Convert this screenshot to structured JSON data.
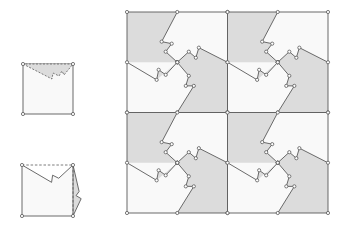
{
  "diagram": {
    "colors": {
      "background": "#ffffff",
      "fill_gray": "#dcdcdc",
      "fill_white": "#f9f9f9",
      "stroke": "#5a5a5a",
      "vertex": "#ffffff"
    },
    "step1": {
      "label": "square-with-top-notch",
      "x": 23,
      "y": 64,
      "size": 50
    },
    "step2": {
      "label": "square-notch-rotated-to-right-edge",
      "x": 22,
      "y": 165,
      "size": 51
    },
    "tiling": {
      "x": 127,
      "y": 12,
      "tile_size": 100.5,
      "rows": 2,
      "cols": 2
    }
  }
}
